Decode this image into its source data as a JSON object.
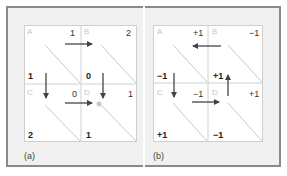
{
  "panels": [
    {
      "label": "(a)",
      "cells": [
        {
          "letter": "A",
          "top_right": "1",
          "bottom_left": "1"
        },
        {
          "letter": "B",
          "top_right": "2",
          "bottom_left": "0"
        },
        {
          "letter": "C",
          "top_right": "0",
          "bottom_left": "2"
        },
        {
          "letter": "D",
          "top_right": "1",
          "bottom_left": "1"
        }
      ],
      "arrows": [
        {
          "from": "A",
          "to": "B",
          "direction": "right"
        },
        {
          "from": "A",
          "to": "C",
          "direction": "down"
        },
        {
          "from": "B",
          "to": "D",
          "direction": "down"
        },
        {
          "from": "C",
          "to": "D",
          "direction": "right"
        }
      ],
      "marker": {
        "cell": "D",
        "shape": "dot"
      }
    },
    {
      "label": "(b)",
      "cells": [
        {
          "letter": "A",
          "top_right": "+1",
          "bottom_left": "−1"
        },
        {
          "letter": "B",
          "top_right": "−1",
          "bottom_left": "+1"
        },
        {
          "letter": "C",
          "top_right": "−1",
          "bottom_left": "+1"
        },
        {
          "letter": "D",
          "top_right": "+1",
          "bottom_left": "−1"
        }
      ],
      "arrows": [
        {
          "from": "B",
          "to": "A",
          "direction": "left"
        },
        {
          "from": "A",
          "to": "C",
          "direction": "down"
        },
        {
          "from": "D",
          "to": "B",
          "direction": "up"
        },
        {
          "from": "C",
          "to": "D",
          "direction": "right"
        }
      ]
    }
  ],
  "colors": {
    "frame_border": "#8a8a8a",
    "frame_fill": "#f1f1f1",
    "grid_line": "#cfcfcf",
    "diagonal": "#c8c8c8",
    "arrow": "#444444",
    "cell_letter": "#c4c4c4",
    "marker": "#c8c8c8"
  }
}
